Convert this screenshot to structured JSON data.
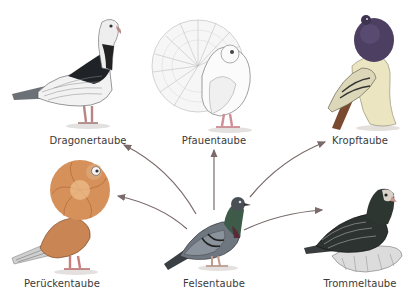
{
  "diagram": {
    "title": "",
    "center": {
      "label": "Felsentaube"
    },
    "breeds": [
      {
        "id": "dragonertaube",
        "label": "Dragonertaube"
      },
      {
        "id": "pfauentaube",
        "label": "Pfauentaube"
      },
      {
        "id": "kropftaube",
        "label": "Kropftaube"
      },
      {
        "id": "perueckentaube",
        "label": "Perückentaube"
      },
      {
        "id": "trommeltaube",
        "label": "Trommeltaube"
      }
    ],
    "arrows": [
      {
        "from": "Felsentaube",
        "to": "Dragonertaube"
      },
      {
        "from": "Felsentaube",
        "to": "Pfauentaube"
      },
      {
        "from": "Felsentaube",
        "to": "Kropftaube"
      },
      {
        "from": "Felsentaube",
        "to": "Perückentaube"
      },
      {
        "from": "Felsentaube",
        "to": "Trommeltaube"
      }
    ],
    "colors": {
      "background": "#ffffff",
      "label_text": "#3a3a3a",
      "arrow": "#7a6a6a"
    }
  }
}
